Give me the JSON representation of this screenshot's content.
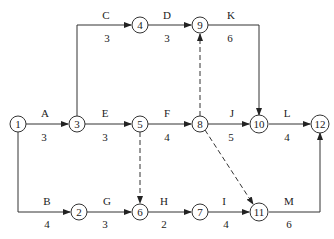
{
  "diagram": {
    "type": "activity-on-arrow network",
    "nodes": [
      {
        "id": "1",
        "x": 18,
        "y": 124
      },
      {
        "id": "2",
        "x": 79,
        "y": 212
      },
      {
        "id": "3",
        "x": 77,
        "y": 124
      },
      {
        "id": "4",
        "x": 140,
        "y": 25
      },
      {
        "id": "5",
        "x": 140,
        "y": 124
      },
      {
        "id": "6",
        "x": 140,
        "y": 212
      },
      {
        "id": "7",
        "x": 200,
        "y": 212
      },
      {
        "id": "8",
        "x": 200,
        "y": 124
      },
      {
        "id": "9",
        "x": 200,
        "y": 25
      },
      {
        "id": "10",
        "x": 259,
        "y": 124
      },
      {
        "id": "11",
        "x": 259,
        "y": 212
      },
      {
        "id": "12",
        "x": 320,
        "y": 124
      }
    ],
    "activities": [
      {
        "name": "A",
        "duration": "3",
        "from": "1",
        "to": "3"
      },
      {
        "name": "B",
        "duration": "4",
        "from": "1",
        "to": "2"
      },
      {
        "name": "C",
        "duration": "3",
        "from": "3",
        "to": "4"
      },
      {
        "name": "D",
        "duration": "3",
        "from": "4",
        "to": "9"
      },
      {
        "name": "E",
        "duration": "3",
        "from": "3",
        "to": "5"
      },
      {
        "name": "F",
        "duration": "4",
        "from": "5",
        "to": "8"
      },
      {
        "name": "G",
        "duration": "3",
        "from": "2",
        "to": "6"
      },
      {
        "name": "H",
        "duration": "2",
        "from": "6",
        "to": "7"
      },
      {
        "name": "I",
        "duration": "4",
        "from": "7",
        "to": "11"
      },
      {
        "name": "J",
        "duration": "5",
        "from": "8",
        "to": "10"
      },
      {
        "name": "K",
        "duration": "6",
        "from": "9",
        "to": "10"
      },
      {
        "name": "L",
        "duration": "4",
        "from": "10",
        "to": "12"
      },
      {
        "name": "M",
        "duration": "6",
        "from": "11",
        "to": "12"
      }
    ],
    "dummies": [
      {
        "from": "5",
        "to": "6"
      },
      {
        "from": "8",
        "to": "9"
      },
      {
        "from": "8",
        "to": "11"
      }
    ]
  }
}
